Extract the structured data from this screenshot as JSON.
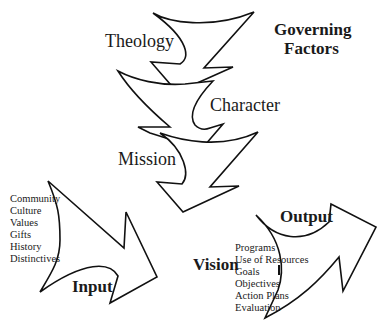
{
  "diagram": {
    "governing": {
      "line1": "Governing",
      "line2": "Factors"
    },
    "factors": [
      {
        "label": "Theology"
      },
      {
        "label": "Character"
      },
      {
        "label": "Mission"
      }
    ],
    "center_label": "Vision",
    "input": {
      "label": "Input",
      "items": [
        "Community",
        "Culture",
        "Values",
        "Gifts",
        "History",
        "Distinctives"
      ]
    },
    "output": {
      "label": "Output",
      "items": [
        "Programs",
        "Use of Resources",
        "Goals",
        "Objectives",
        "Action Plans",
        "Evaluation"
      ]
    },
    "colors": {
      "stroke": "#111111",
      "background": "#ffffff",
      "text": "#1a1a1a"
    }
  }
}
